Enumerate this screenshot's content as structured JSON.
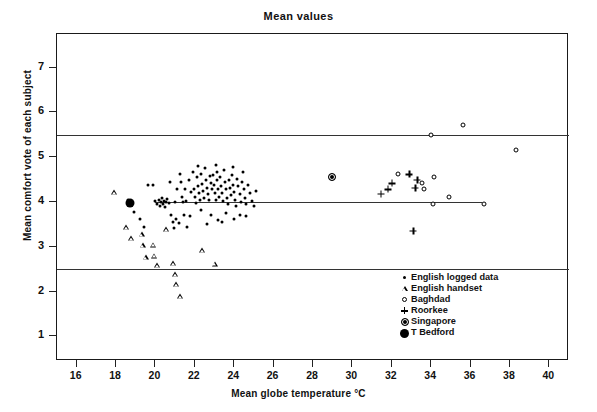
{
  "chart_data": {
    "type": "scatter",
    "title": "Mean values",
    "xlabel": "Mean globe temperature °C",
    "ylabel": "Mean comfort vote of each subject",
    "xlim": [
      15,
      41
    ],
    "ylim": [
      0.45,
      7.75
    ],
    "xticks": [
      16,
      18,
      20,
      22,
      24,
      26,
      28,
      30,
      32,
      34,
      36,
      38,
      40
    ],
    "yticks": [
      1,
      2,
      3,
      4,
      5,
      6,
      7
    ],
    "grid": false,
    "band_lines": [
      2.5,
      5.5
    ],
    "neutral_line": {
      "y": 4,
      "x_start": 20.0,
      "x_end": 36.6
    },
    "scale_labels": [
      {
        "value": 7,
        "label": "Much too warm"
      },
      {
        "value": 6,
        "label": "Too warm"
      },
      {
        "value": 5,
        "label": "Comfortably\nwarm"
      },
      {
        "value": 4,
        "label": "Neutral"
      },
      {
        "value": 3,
        "label": "Comfortably\ncool"
      },
      {
        "value": 2,
        "label": "Too cool"
      },
      {
        "value": 1,
        "label": "Much too cool"
      }
    ],
    "legend_position": "bottom-right",
    "series": [
      {
        "name": "English logged data",
        "marker": "dot",
        "points": [
          [
            18.6,
            4.05
          ],
          [
            18.9,
            3.78
          ],
          [
            19.2,
            3.62
          ],
          [
            19.4,
            3.45
          ],
          [
            19.6,
            4.38
          ],
          [
            19.85,
            4.38
          ],
          [
            20.0,
            4.02
          ],
          [
            20.1,
            3.96
          ],
          [
            20.2,
            4.05
          ],
          [
            20.25,
            3.92
          ],
          [
            20.3,
            4.0
          ],
          [
            20.35,
            4.08
          ],
          [
            20.4,
            3.95
          ],
          [
            20.45,
            4.02
          ],
          [
            20.5,
            3.88
          ],
          [
            20.55,
            4.0
          ],
          [
            20.6,
            4.06
          ],
          [
            20.7,
            3.98
          ],
          [
            20.8,
            3.72
          ],
          [
            20.9,
            3.55
          ],
          [
            21.0,
            4.0
          ],
          [
            21.05,
            3.62
          ],
          [
            21.1,
            4.28
          ],
          [
            21.2,
            3.52
          ],
          [
            21.3,
            4.45
          ],
          [
            21.35,
            4.12
          ],
          [
            21.4,
            4.0
          ],
          [
            21.5,
            4.3
          ],
          [
            21.55,
            4.02
          ],
          [
            21.6,
            3.45
          ],
          [
            21.7,
            4.5
          ],
          [
            21.8,
            4.22
          ],
          [
            21.9,
            4.68
          ],
          [
            21.95,
            4.3
          ],
          [
            22.0,
            4.12
          ],
          [
            22.05,
            3.98
          ],
          [
            22.1,
            4.55
          ],
          [
            22.15,
            4.35
          ],
          [
            22.2,
            4.2
          ],
          [
            22.25,
            4.05
          ],
          [
            22.3,
            4.62
          ],
          [
            22.35,
            4.4
          ],
          [
            22.4,
            4.25
          ],
          [
            22.45,
            4.1
          ],
          [
            22.5,
            4.75
          ],
          [
            22.55,
            4.5
          ],
          [
            22.6,
            4.32
          ],
          [
            22.65,
            4.18
          ],
          [
            22.7,
            4.05
          ],
          [
            22.75,
            4.58
          ],
          [
            22.8,
            4.42
          ],
          [
            22.85,
            4.28
          ],
          [
            22.9,
            4.6
          ],
          [
            22.95,
            4.38
          ],
          [
            23.0,
            4.2
          ],
          [
            23.05,
            4.05
          ],
          [
            23.1,
            4.68
          ],
          [
            23.15,
            4.48
          ],
          [
            23.2,
            4.3
          ],
          [
            23.25,
            4.12
          ],
          [
            23.3,
            4.55
          ],
          [
            23.35,
            4.35
          ],
          [
            23.4,
            4.2
          ],
          [
            23.45,
            4.02
          ],
          [
            23.5,
            4.72
          ],
          [
            23.55,
            4.45
          ],
          [
            23.6,
            4.28
          ],
          [
            23.65,
            4.1
          ],
          [
            23.7,
            3.95
          ],
          [
            23.75,
            4.5
          ],
          [
            23.8,
            4.32
          ],
          [
            23.85,
            4.15
          ],
          [
            23.9,
            4.6
          ],
          [
            23.95,
            4.38
          ],
          [
            24.0,
            4.22
          ],
          [
            24.05,
            4.05
          ],
          [
            24.1,
            3.9
          ],
          [
            24.15,
            4.52
          ],
          [
            24.2,
            4.35
          ],
          [
            24.3,
            4.18
          ],
          [
            24.35,
            4.0
          ],
          [
            24.4,
            4.45
          ],
          [
            24.5,
            4.28
          ],
          [
            24.55,
            4.1
          ],
          [
            24.6,
            3.95
          ],
          [
            24.7,
            4.38
          ],
          [
            24.8,
            4.2
          ],
          [
            24.9,
            4.02
          ],
          [
            25.0,
            3.9
          ],
          [
            25.1,
            4.25
          ],
          [
            21.45,
            3.72
          ],
          [
            21.75,
            3.68
          ],
          [
            22.3,
            3.82
          ],
          [
            22.8,
            3.7
          ],
          [
            23.2,
            3.6
          ],
          [
            23.6,
            3.75
          ],
          [
            24.0,
            3.62
          ],
          [
            24.3,
            3.72
          ],
          [
            24.6,
            3.68
          ],
          [
            22.6,
            3.5
          ],
          [
            23.4,
            3.55
          ],
          [
            20.75,
            4.45
          ],
          [
            21.25,
            4.62
          ],
          [
            22.15,
            4.8
          ],
          [
            23.05,
            4.82
          ],
          [
            23.95,
            4.78
          ],
          [
            24.45,
            4.68
          ],
          [
            20.95,
            3.42
          ]
        ]
      },
      {
        "name": "English handset",
        "marker": "triangle",
        "points": [
          [
            17.9,
            4.22
          ],
          [
            18.5,
            3.55
          ],
          [
            18.75,
            3.42
          ],
          [
            19.3,
            3.62
          ],
          [
            19.35,
            3.48
          ],
          [
            19.5,
            3.32
          ],
          [
            19.9,
            3.72
          ],
          [
            19.95,
            3.58
          ],
          [
            20.1,
            3.48
          ],
          [
            20.55,
            4.4
          ],
          [
            20.9,
            3.75
          ],
          [
            21.0,
            3.62
          ],
          [
            21.05,
            3.5
          ],
          [
            21.25,
            3.35
          ],
          [
            22.35,
            4.48
          ],
          [
            23.0,
            4.3
          ]
        ]
      },
      {
        "name": "Baghdad",
        "marker": "open-circle",
        "points": [
          [
            34.0,
            5.5
          ],
          [
            35.6,
            5.72
          ],
          [
            32.3,
            4.62
          ],
          [
            33.55,
            4.42
          ],
          [
            33.65,
            4.28
          ],
          [
            34.15,
            4.55
          ],
          [
            34.9,
            4.12
          ],
          [
            34.1,
            3.95
          ],
          [
            36.7,
            3.95
          ],
          [
            38.3,
            5.15
          ]
        ]
      },
      {
        "name": "Roorkee",
        "marker": "plus",
        "points": [
          [
            31.8,
            4.28
          ],
          [
            32.0,
            4.42
          ],
          [
            32.9,
            4.62
          ],
          [
            33.3,
            4.5
          ],
          [
            33.2,
            4.32
          ],
          [
            31.45,
            4.18
          ],
          [
            33.1,
            3.35
          ]
        ]
      },
      {
        "name": "Singapore",
        "marker": "ringed-circle",
        "points": [
          [
            28.95,
            4.55
          ]
        ]
      },
      {
        "name": "T Bedford",
        "marker": "filled-circle",
        "points": [
          [
            18.72,
            3.97
          ]
        ]
      }
    ]
  }
}
